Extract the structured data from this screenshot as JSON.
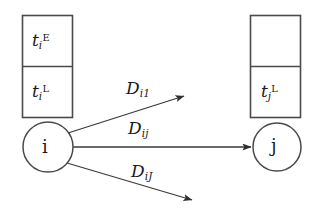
{
  "figure": {
    "background_color": "#ffffff",
    "line_color": "#3a3a3a",
    "text_color": "#1a1a1a"
  },
  "left_box": {
    "name": "time-window-box-i",
    "upper_cell": {
      "symbol": "t",
      "subscript": "i",
      "superscript": "E",
      "text": "tiE"
    },
    "lower_cell": {
      "symbol": "t",
      "subscript": "i",
      "superscript": "L",
      "text": "tiL"
    }
  },
  "right_box": {
    "name": "time-window-box-j",
    "upper_cell": {
      "symbol": "",
      "subscript": "",
      "superscript": "",
      "text": ""
    },
    "lower_cell": {
      "symbol": "t",
      "subscript": "j",
      "superscript": "L",
      "text": "tjL"
    }
  },
  "nodes": [
    {
      "id": "i",
      "label": "i",
      "cx": 48,
      "cy": 147,
      "r": 25
    },
    {
      "id": "j",
      "label": "j",
      "cx": 277,
      "cy": 147,
      "r": 24
    }
  ],
  "arcs": [
    {
      "id": "arc-top",
      "symbol": "D",
      "subscript": "i1",
      "label": "Di1",
      "from": "i",
      "to": "unlabeled-upper-target",
      "direction": "up-right"
    },
    {
      "id": "arc-middle",
      "symbol": "D",
      "subscript": "ij",
      "label": "Dij",
      "from": "i",
      "to": "j",
      "direction": "right"
    },
    {
      "id": "arc-bottom",
      "symbol": "D",
      "subscript": "iJ",
      "label": "DiJ",
      "from": "i",
      "to": "unlabeled-lower-target",
      "direction": "down-right"
    }
  ]
}
